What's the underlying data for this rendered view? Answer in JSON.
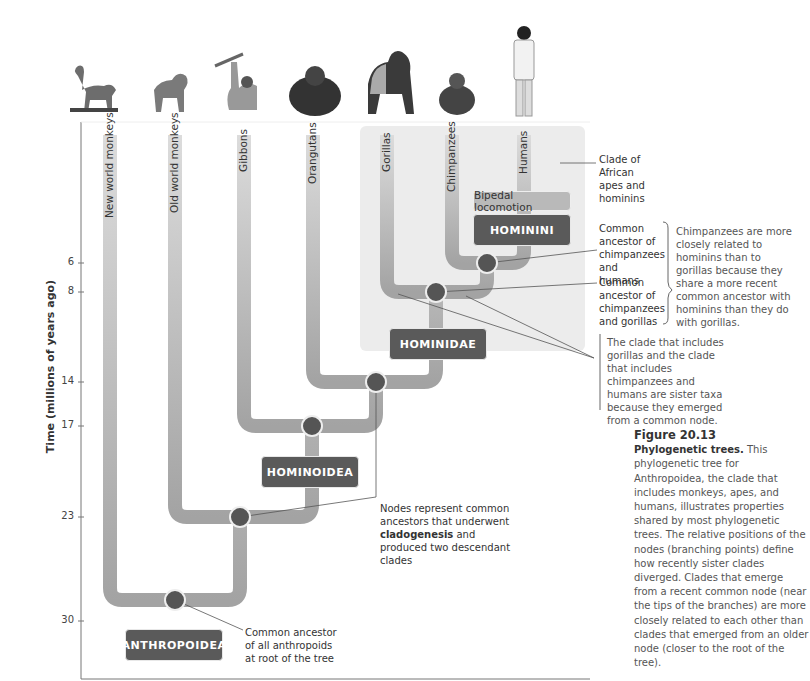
{
  "figure": {
    "number": "Figure 20.13",
    "caption_title": "Phylogenetic trees.",
    "caption_body": "This phylogenetic tree for Anthropoidea, the clade that includes monkeys, apes, and humans, illustrates properties shared by most phylogenetic trees. The relative positions of the nodes (branching points) define how recently sister clades diverged. Clades that emerge from a recent common node (near the tips of the branches) are more closely related to each other than clades that emerged from an older node (closer to the root of the tree)."
  },
  "axis": {
    "label": "Time (millions of years ago)",
    "ticks": [
      "6",
      "8",
      "14",
      "17",
      "23",
      "30"
    ]
  },
  "taxa": [
    "New world monkeys",
    "Old world monkeys",
    "Gibbons",
    "Orangutans",
    "Gorillas",
    "Chimpanzees",
    "Humans"
  ],
  "animals": [
    "new-world-monkey",
    "old-world-monkey",
    "gibbon",
    "orangutan",
    "gorilla",
    "chimpanzee",
    "human"
  ],
  "clades": {
    "anthropoidea": "ANTHROPOIDEA",
    "hominoidea": "HOMINOIDEA",
    "hominidae": "HOMINIDAE",
    "hominini": "HOMININI",
    "bipedal": "Bipedal locomotion"
  },
  "annotations": {
    "african_clade": "Clade of African apes and hominins",
    "ancestor_chimp_human": "Common ancestor of chimpanzees and humans",
    "ancestor_chimp_gorilla": "Common ancestor of chimpanzees and gorillas",
    "chimp_explanation": "Chimpanzees are more closely related to hominins than to gorillas because they share a more recent common ancestor with hominins than they do with gorillas.",
    "sister_taxa": "The clade that includes gorillas and the clade that includes chimpanzees and humans are sister taxa because they emerged from a common node.",
    "nodes_prefix": "Nodes represent common ancestors that underwent ",
    "nodes_bold": "cladogenesis",
    "nodes_suffix": " and produced two descendant clades",
    "root": "Common ancestor of all anthropoids at root of the tree"
  },
  "colors": {
    "branch": "#a3a3a3",
    "branch_light": "#c9c9c9",
    "node": "#555555",
    "clade_box": "#5a5a5a",
    "african_bg": "#ececec"
  }
}
